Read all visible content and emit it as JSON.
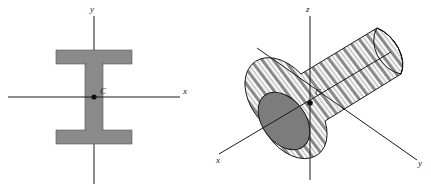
{
  "figure": {
    "background_color": "#ffffff",
    "line_color": "#1a1a1a",
    "fill_gray": "#8a8a8a",
    "fill_gray_dark": "#6f6f6f",
    "stripe_light": "#ffffff",
    "stripe_dark": "#8a8a8a"
  },
  "left_figure": {
    "name": "i-beam-cross-section",
    "shape": "I-beam",
    "centroid_label": "C",
    "axes": [
      {
        "id": "x",
        "label": "x",
        "orientation": "horizontal"
      },
      {
        "id": "y",
        "label": "y",
        "orientation": "vertical"
      }
    ]
  },
  "right_figure": {
    "name": "circular-cylinder",
    "shape": "cylinder",
    "centroid_label": "C",
    "axes": [
      {
        "id": "x",
        "label": "x",
        "orientation": "lower-left"
      },
      {
        "id": "y",
        "label": "y",
        "orientation": "lower-right"
      },
      {
        "id": "z",
        "label": "z",
        "orientation": "vertical"
      }
    ]
  }
}
